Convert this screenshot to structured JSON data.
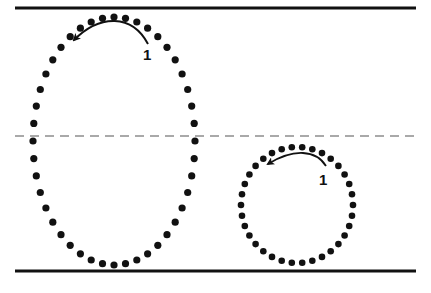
{
  "diagram": {
    "colors": {
      "ink": "#111111",
      "background": "#ffffff",
      "dash": "#555555"
    },
    "lines": {
      "top": {
        "y": 8,
        "x1": 15,
        "x2": 416,
        "style": "solid"
      },
      "middle": {
        "y": 136,
        "x1": 15,
        "x2": 416,
        "style": "dashed"
      },
      "bottom": {
        "y": 271,
        "x1": 15,
        "x2": 416,
        "style": "solid"
      }
    },
    "loops": [
      {
        "name": "large-loop",
        "cx": 114,
        "cy": 141,
        "rx": 81,
        "ry": 124,
        "dots": 44,
        "label": "1",
        "label_x": 143,
        "label_y": 48
      },
      {
        "name": "small-loop",
        "cx": 297,
        "cy": 205,
        "rx": 56,
        "ry": 58,
        "dots": 34,
        "label": "1",
        "label_x": 319,
        "label_y": 172
      }
    ]
  }
}
